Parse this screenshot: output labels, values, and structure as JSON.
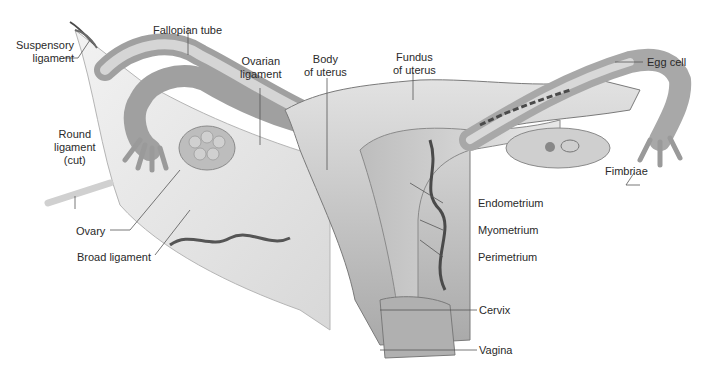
{
  "diagram": {
    "labels": {
      "suspensory_ligament_1": "Suspensory",
      "suspensory_ligament_2": "ligament",
      "fallopian_tube": "Fallopian tube",
      "ovarian_ligament_1": "Ovarian",
      "ovarian_ligament_2": "ligament",
      "body_of_uterus_1": "Body",
      "body_of_uterus_2": "of uterus",
      "fundus_of_uterus_1": "Fundus",
      "fundus_of_uterus_2": "of uterus",
      "egg_cell": "Egg cell",
      "fimbriae": "Fimbriae",
      "round_ligament_1": "Round",
      "round_ligament_2": "ligament",
      "round_ligament_3": "(cut)",
      "ovary": "Ovary",
      "broad_ligament": "Broad ligament",
      "endometrium": "Endometrium",
      "myometrium": "Myometrium",
      "perimetrium": "Perimetrium",
      "cervix": "Cervix",
      "vagina": "Vagina"
    },
    "colors": {
      "tissue": "#c9c9c9",
      "tissue_dark": "#9a9a9a",
      "ligament": "#e6e6e6",
      "outline": "#7a7a7a",
      "vessel": "#4a4a4a",
      "leader": "#555555"
    }
  }
}
